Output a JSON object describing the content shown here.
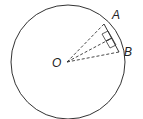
{
  "diagram": {
    "type": "circle-chord-geometry",
    "labels": {
      "center": "O",
      "point_a": "A",
      "point_b": "B"
    },
    "elements": [
      "circle centered at O",
      "dashed radius OA",
      "dashed radius OB",
      "dashed line from O perpendicular to chord AB",
      "chord AB",
      "right-angle markers at foot of perpendicular"
    ],
    "colors": {
      "stroke": "#333333",
      "background": "#ffffff"
    }
  }
}
